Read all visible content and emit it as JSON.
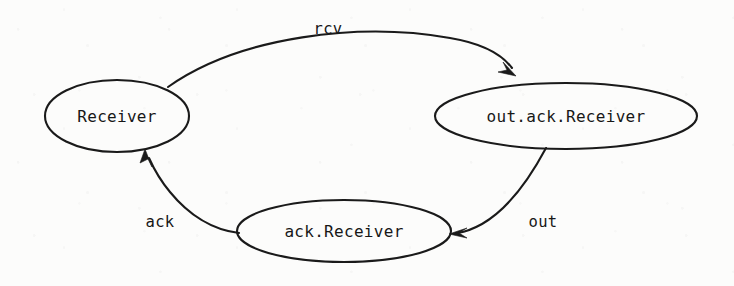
{
  "diagram": {
    "type": "state-transition-diagram",
    "background_color": "#fcfcfb",
    "stroke_color": "#1a1a1a",
    "text_color": "#171717",
    "nodes": [
      {
        "id": "receiver",
        "label": "Receiver",
        "shape": "ellipse",
        "cx": 117,
        "cy": 116,
        "rx": 72,
        "ry": 36
      },
      {
        "id": "out-ack-receiver",
        "label": "out.ack.Receiver",
        "shape": "ellipse",
        "cx": 566,
        "cy": 116,
        "rx": 131,
        "ry": 33
      },
      {
        "id": "ack-receiver",
        "label": "ack.Receiver",
        "shape": "ellipse",
        "cx": 344,
        "cy": 231,
        "rx": 107,
        "ry": 31
      }
    ],
    "edges": [
      {
        "id": "edge-rcv",
        "label": "rcv",
        "from": "receiver",
        "to": "out-ack-receiver",
        "label_x": 328,
        "label_y": 29
      },
      {
        "id": "edge-out",
        "label": "out",
        "from": "out-ack-receiver",
        "to": "ack-receiver",
        "label_x": 543,
        "label_y": 222
      },
      {
        "id": "edge-ack",
        "label": "ack",
        "from": "ack-receiver",
        "to": "receiver",
        "label_x": 160,
        "label_y": 222
      }
    ]
  }
}
